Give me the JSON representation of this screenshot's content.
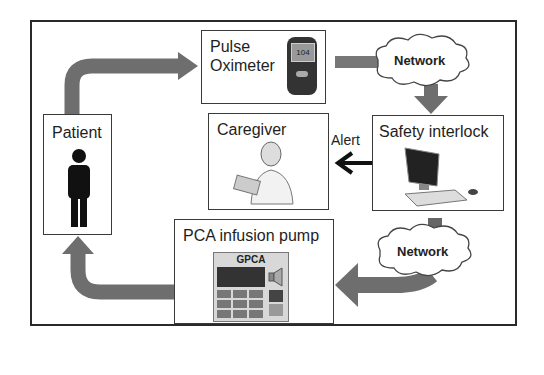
{
  "diagram": {
    "nodes": {
      "patient": {
        "label": "Patient",
        "icon": "person-icon"
      },
      "pulse_oximeter": {
        "label_line1": "Pulse",
        "label_line2": "Oximeter",
        "icon": "oximeter-device-icon",
        "display_value": "104"
      },
      "network_top": {
        "label": "Network",
        "icon": "cloud-icon"
      },
      "safety_interlock": {
        "label": "Safety interlock",
        "icon": "computer-icon"
      },
      "caregiver": {
        "label": "Caregiver",
        "icon": "nurse-icon"
      },
      "network_bottom": {
        "label": "Network",
        "icon": "cloud-icon"
      },
      "pca_pump": {
        "label": "PCA infusion pump",
        "device_label": "GPCA",
        "icon": "infusion-pump-icon"
      }
    },
    "edges": [
      {
        "from": "Patient",
        "to": "Pulse Oximeter"
      },
      {
        "from": "Pulse Oximeter",
        "to": "Network"
      },
      {
        "from": "Network",
        "to": "Safety interlock"
      },
      {
        "from": "Safety interlock",
        "to": "Caregiver",
        "label": "Alert"
      },
      {
        "from": "Safety interlock",
        "to": "Network"
      },
      {
        "from": "Network",
        "to": "PCA infusion pump"
      },
      {
        "from": "PCA infusion pump",
        "to": "Patient"
      }
    ],
    "colors": {
      "arrow": "#6e6e6e",
      "alert_arrow": "#111111",
      "border": "#333333"
    }
  }
}
